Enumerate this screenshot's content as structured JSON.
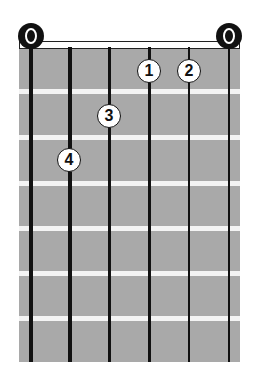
{
  "diagram": {
    "type": "guitar-chord-diagram",
    "strings": 6,
    "frets_shown": 6,
    "open_strings": [
      "O",
      "O"
    ],
    "open_string_positions": [
      6,
      1
    ],
    "fingers": [
      {
        "label": "1",
        "string": 3,
        "fret": 1
      },
      {
        "label": "2",
        "string": 2,
        "fret": 1
      },
      {
        "label": "3",
        "string": 4,
        "fret": 2
      },
      {
        "label": "4",
        "string": 5,
        "fret": 3
      }
    ],
    "colors": {
      "fretboard": "#a9a9a9",
      "fret": "#f3f3f3",
      "string": "#111111",
      "finger_fill": "#ffffff"
    }
  }
}
